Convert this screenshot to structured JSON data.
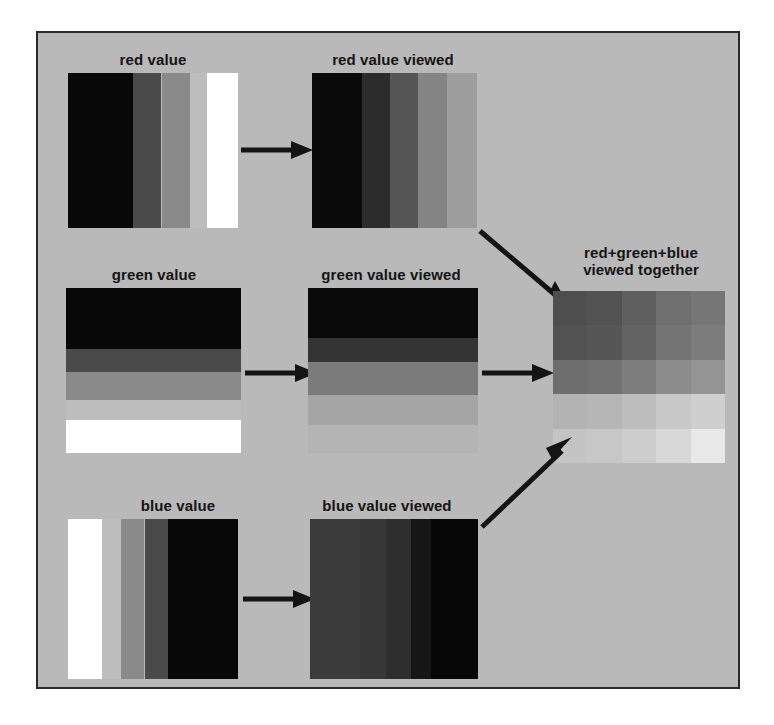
{
  "figure": {
    "background_color": "#b9b9b9",
    "border_color": "#2a2a2a"
  },
  "panels": [
    {
      "id": "red-value",
      "label": "red value",
      "orientation": "vertical",
      "bands": [
        "#080808",
        "#4a4a4a",
        "#8a8a8a",
        "#bdbdbd",
        "#ffffff"
      ]
    },
    {
      "id": "red-value-viewed",
      "label": "red value viewed",
      "orientation": "vertical",
      "bands": [
        "#0a0a0a",
        "#2c2c2c",
        "#565656",
        "#848484",
        "#9d9d9d"
      ]
    },
    {
      "id": "green-value",
      "label": "green value",
      "orientation": "horizontal",
      "bands": [
        "#080808",
        "#4a4a4a",
        "#8a8a8a",
        "#bdbdbd",
        "#ffffff"
      ]
    },
    {
      "id": "green-value-viewed",
      "label": "green value viewed",
      "orientation": "horizontal",
      "bands": [
        "#0a0a0a",
        "#343434",
        "#7b7b7b",
        "#a5a5a5",
        "#b4b4b4"
      ]
    },
    {
      "id": "blue-value",
      "label": "blue value",
      "orientation": "vertical",
      "bands": [
        "#ffffff",
        "#bdbdbd",
        "#8a8a8a",
        "#4a4a4a",
        "#080808"
      ]
    },
    {
      "id": "blue-value-viewed",
      "label": "blue value viewed",
      "orientation": "vertical",
      "bands": [
        "#3b3b3b",
        "#373737",
        "#2e2e2e",
        "#161616",
        "#070707"
      ]
    },
    {
      "id": "combined",
      "label": "red+green+blue\nviewed together"
    }
  ],
  "chart_data": {
    "type": "heatmap",
    "title": "red+green+blue viewed together",
    "xlabel": "red value (left to right)",
    "ylabel": "green value (top to bottom)",
    "columns": [
      "r1",
      "r2",
      "r3",
      "r4",
      "r5"
    ],
    "rows": [
      "g1",
      "g2",
      "g3",
      "g4",
      "g5"
    ],
    "grid": false,
    "legend": "none",
    "cells": [
      [
        "#4e4e4e",
        "#525252",
        "#5f5f5f",
        "#6f6f6f",
        "#767676"
      ],
      [
        "#525252",
        "#565656",
        "#636363",
        "#747474",
        "#7c7c7c"
      ],
      [
        "#6e6e6e",
        "#727272",
        "#7d7d7d",
        "#8d8d8d",
        "#949494"
      ],
      [
        "#b3b3b3",
        "#b6b6b6",
        "#bdbdbd",
        "#c8c8c8",
        "#cfcfcf"
      ],
      [
        "#c4c4c4",
        "#c7c7c7",
        "#cdcdcd",
        "#d8d8d8",
        "#e8e8e8"
      ]
    ]
  },
  "arrows": [
    {
      "id": "red-to-red-viewed",
      "direction": "right"
    },
    {
      "id": "green-to-green-viewed",
      "direction": "right"
    },
    {
      "id": "blue-to-blue-viewed",
      "direction": "right"
    },
    {
      "id": "red-viewed-to-combined",
      "direction": "down-right"
    },
    {
      "id": "green-viewed-to-combined",
      "direction": "right"
    },
    {
      "id": "blue-viewed-to-combined",
      "direction": "up-right"
    }
  ]
}
